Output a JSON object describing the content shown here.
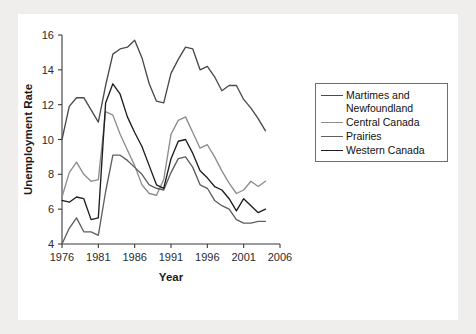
{
  "figure": {
    "background": "#ffffff",
    "page_background": "#efeeec"
  },
  "chart_data": {
    "type": "line",
    "title": "",
    "xlabel": "Year",
    "ylabel": "Unemployment Rate",
    "xlim": [
      1976,
      2006
    ],
    "ylim": [
      4,
      16
    ],
    "xticks": [
      1976,
      1981,
      1986,
      1991,
      1996,
      2001,
      2006
    ],
    "yticks": [
      4,
      6,
      8,
      10,
      12,
      14,
      16
    ],
    "grid": false,
    "legend_position": "right",
    "x": [
      1976,
      1977,
      1978,
      1979,
      1980,
      1981,
      1982,
      1983,
      1984,
      1985,
      1986,
      1987,
      1988,
      1989,
      1990,
      1991,
      1992,
      1993,
      1994,
      1995,
      1996,
      1997,
      1998,
      1999,
      2000,
      2001,
      2002,
      2003,
      2004
    ],
    "series": [
      {
        "name": "Martimes and Newfoundland",
        "color": "#4a4a4a",
        "width": 1.35,
        "values": [
          10.0,
          11.9,
          12.4,
          12.4,
          11.7,
          11.0,
          13.1,
          14.9,
          15.2,
          15.3,
          15.7,
          14.7,
          13.2,
          12.2,
          12.1,
          13.8,
          14.6,
          15.3,
          15.2,
          14.0,
          14.2,
          13.6,
          12.8,
          13.1,
          13.1,
          12.3,
          11.8,
          11.2,
          10.5
        ]
      },
      {
        "name": "Central Canada",
        "color": "#8d8d8d",
        "width": 1.35,
        "values": [
          6.7,
          8.1,
          8.7,
          8.0,
          7.6,
          7.7,
          11.6,
          11.4,
          10.3,
          9.4,
          8.5,
          7.4,
          6.9,
          6.8,
          7.7,
          10.3,
          11.1,
          11.3,
          10.4,
          9.5,
          9.7,
          9.0,
          8.2,
          7.5,
          6.9,
          7.1,
          7.6,
          7.3,
          7.6
        ]
      },
      {
        "name": "Prairies",
        "color": "#5f5f5f",
        "width": 1.35,
        "values": [
          4.0,
          4.9,
          5.5,
          4.7,
          4.7,
          4.5,
          7.0,
          9.1,
          9.1,
          8.8,
          8.4,
          8.0,
          7.4,
          7.2,
          7.1,
          8.1,
          8.9,
          9.0,
          8.4,
          7.4,
          7.2,
          6.5,
          6.2,
          6.0,
          5.4,
          5.2,
          5.2,
          5.3,
          5.3
        ]
      },
      {
        "name": "Western Canada",
        "color": "#1e1e1e",
        "width": 1.55,
        "values": [
          6.5,
          6.4,
          6.7,
          6.6,
          5.4,
          5.5,
          12.1,
          13.2,
          12.6,
          11.3,
          10.4,
          9.6,
          8.5,
          7.4,
          7.2,
          8.9,
          9.9,
          10.0,
          9.2,
          8.2,
          7.8,
          7.3,
          7.1,
          6.6,
          5.9,
          6.6,
          6.2,
          5.8,
          6.0
        ]
      }
    ]
  }
}
